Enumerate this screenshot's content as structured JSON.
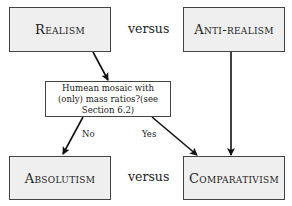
{
  "nodes": {
    "realism": "Realism",
    "anti_realism": "Anti-realism",
    "question": "Humean mosaic with (only) mass ratios?(see Section 6.2)",
    "absolutism": "Absolutism",
    "comparativism": "Comparativism"
  },
  "connectors": {
    "versus_top": "versus",
    "versus_bottom": "versus"
  },
  "edge_labels": {
    "no": "No",
    "yes": "Yes"
  },
  "edges": [
    {
      "from": "realism",
      "to": "question"
    },
    {
      "from": "question",
      "to": "absolutism",
      "label": "No"
    },
    {
      "from": "question",
      "to": "comparativism",
      "label": "Yes"
    },
    {
      "from": "anti_realism",
      "to": "comparativism"
    }
  ]
}
